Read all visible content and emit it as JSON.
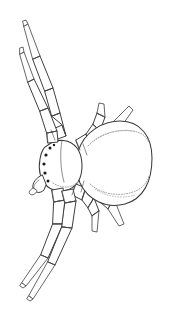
{
  "image": {
    "subject": "spider",
    "style": "black and white line drawing, coloring-book outline",
    "view": "dorsal top-down view",
    "background_color": "#ffffff",
    "line_color": "#3a3a3a",
    "shading_color": "#8d8d8d",
    "eye_color": "#1a1a1a",
    "width_px": 175,
    "height_px": 322,
    "alt_text": "Line drawing of a spider seen from above with a large oval abdomen and eight segmented legs"
  },
  "anatomy": {
    "abdomen": {
      "name": "abdomen",
      "shape": "large rounded oval",
      "center_x": 110,
      "center_y": 163,
      "radius_x": 42,
      "radius_y": 40,
      "markings": "two stippled crescent arcs along upper and lower inner edges"
    },
    "cephalothorax": {
      "name": "cephalothorax",
      "shape": "rounded shield",
      "center_x": 61,
      "center_y": 164,
      "radius_x": 22,
      "radius_y": 25
    },
    "eyes": {
      "name": "eye-cluster",
      "count": 6,
      "positions": [
        {
          "x": 47,
          "y": 151
        },
        {
          "x": 44,
          "y": 158
        },
        {
          "x": 43,
          "y": 166
        },
        {
          "x": 44,
          "y": 174
        },
        {
          "x": 50,
          "y": 147
        },
        {
          "x": 47,
          "y": 180
        }
      ],
      "radius": 1.5
    },
    "chelicerae": {
      "name": "chelicerae",
      "description": "curved fang pair at lower front of cephalothorax"
    },
    "legs": [
      {
        "id": 1,
        "name": "front-left-leg-upper",
        "direction": "up-left",
        "segments": 4,
        "tip_x": 26,
        "tip_y": 22
      },
      {
        "id": 2,
        "name": "front-left-leg-lower",
        "direction": "up-left",
        "segments": 4,
        "tip_x": 23,
        "tip_y": 47
      },
      {
        "id": 3,
        "name": "front-right-leg-upper",
        "direction": "up-right",
        "segments": 4,
        "tip_x": 129,
        "tip_y": 106
      },
      {
        "id": 4,
        "name": "front-right-leg-inner",
        "direction": "up-right",
        "segments": 4,
        "tip_x": 99,
        "tip_y": 103
      },
      {
        "id": 5,
        "name": "rear-right-leg-outer",
        "direction": "down-right",
        "segments": 4,
        "tip_x": 124,
        "tip_y": 224
      },
      {
        "id": 6,
        "name": "rear-right-leg-inner",
        "direction": "down-right",
        "segments": 4,
        "tip_x": 97,
        "tip_y": 232
      },
      {
        "id": 7,
        "name": "rear-left-leg-upper",
        "direction": "down-left",
        "segments": 4,
        "tip_x": 23,
        "tip_y": 288
      },
      {
        "id": 8,
        "name": "rear-left-leg-lower",
        "direction": "down-left",
        "segments": 4,
        "tip_x": 30,
        "tip_y": 301
      }
    ],
    "leg_count": 8
  }
}
